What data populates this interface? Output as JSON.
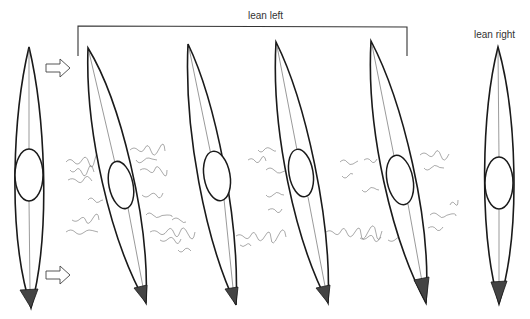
{
  "figure": {
    "labels": {
      "lean_left": "lean left",
      "lean_right": "lean right"
    },
    "colors": {
      "ink": "#1a1a1a",
      "stern_fill": "#444444",
      "background": "#ffffff"
    },
    "kayaks": [
      {
        "id": 1,
        "pose": "upright",
        "group": "start"
      },
      {
        "id": 2,
        "pose": "lean left",
        "group": "lean left"
      },
      {
        "id": 3,
        "pose": "lean left",
        "group": "lean left"
      },
      {
        "id": 4,
        "pose": "lean left",
        "group": "lean left"
      },
      {
        "id": 5,
        "pose": "lean left",
        "group": "lean left"
      },
      {
        "id": 6,
        "pose": "upright",
        "group": "lean right"
      }
    ],
    "arrows": [
      {
        "id": "bow-arrow",
        "direction": "right"
      },
      {
        "id": "stern-arrow",
        "direction": "right"
      }
    ]
  }
}
